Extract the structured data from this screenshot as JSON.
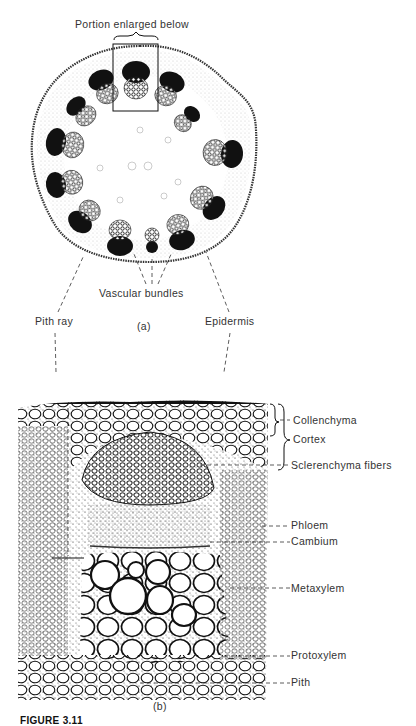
{
  "figure": {
    "caption": "FIGURE 3.11",
    "part_a": {
      "label": "(a)",
      "annotation_top": "Portion enlarged below",
      "labels": {
        "vascular_bundles": "Vascular bundles",
        "pith_ray": "Pith ray",
        "epidermis": "Epidermis"
      }
    },
    "part_b": {
      "label": "(b)",
      "labels": [
        {
          "id": "collenchyma",
          "text": "Collenchyma"
        },
        {
          "id": "cortex",
          "text": "Cortex"
        },
        {
          "id": "sclerenchyma",
          "text": "Sclerenchyma fibers"
        },
        {
          "id": "phloem",
          "text": "Phloem"
        },
        {
          "id": "cambium",
          "text": "Cambium"
        },
        {
          "id": "metaxylem",
          "text": "Metaxylem"
        },
        {
          "id": "protoxylem",
          "text": "Protoxylem"
        },
        {
          "id": "pith",
          "text": "Pith"
        }
      ]
    }
  },
  "colors": {
    "ink": "#111111",
    "text": "#333333",
    "background": "#ffffff"
  }
}
